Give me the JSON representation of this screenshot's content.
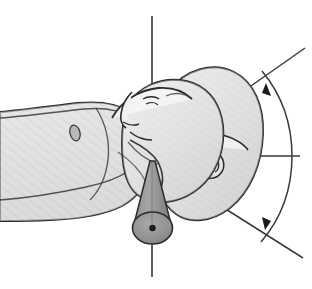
{
  "figure": {
    "title": "Cervical spine rotation range of motion",
    "view": "superior oblique",
    "width": 312,
    "height": 289,
    "background_color": "#ffffff"
  },
  "palette": {
    "background": "#ffffff",
    "skin_light": "#e8e8e8",
    "skin_mid": "#d8d8d8",
    "skin_shadow": "#c2c2c2",
    "skin_highlight": "#f4f4f4",
    "cone_fill": "#9a9a9a",
    "cone_base": "#8e8e8e",
    "outline": "#2b2b2b",
    "line_thin": "#3a3a3a",
    "hatch_stroke": "#cfcfcf"
  },
  "anatomy": {
    "torso": {
      "label": "torso-and-shoulder",
      "fill": "#dedede",
      "hatched": true
    },
    "neck": {
      "label": "neck",
      "fill": "#dcdcdc"
    },
    "head_neutral": {
      "label": "head-neutral-position",
      "fill": "#e2e2e2",
      "position_name": "neutral"
    },
    "head_rotated": {
      "label": "head-rotated-position",
      "fill": "#dcdcdc",
      "position_name": "rotated"
    },
    "ear": {
      "label": "ear",
      "fill": "#e0e0e0"
    },
    "nipple_landmark": {
      "label": "chest-landmark",
      "fill": "#b8b8b8"
    }
  },
  "measurement": {
    "axis_vertical_top": {
      "label": "vertical-reference-axis-superior",
      "stroke": "#3a3a3a"
    },
    "axis_vertical_bottom": {
      "label": "rotation-axis-inferior",
      "stroke": "#3a3a3a"
    },
    "axis_horizontal": {
      "label": "horizontal-reference-axis",
      "stroke": "#3a3a3a"
    },
    "arc": {
      "label": "rotation-arc",
      "stroke": "#3a3a3a",
      "direction": "bidirectional"
    },
    "ray_superior": {
      "label": "angle-ray-superior",
      "stroke": "#3a3a3a"
    },
    "ray_inferior": {
      "label": "angle-ray-inferior",
      "stroke": "#3a3a3a"
    },
    "pivot_cone": {
      "label": "rotation-axis-cone",
      "fill": "#9a9a9a"
    },
    "pivot_point": {
      "label": "rotation-center-point",
      "fill": "#1a1a1a"
    },
    "arrowhead_superior": {
      "label": "arrowhead-superior",
      "fill": "#1a1a1a"
    },
    "arrowhead_inferior": {
      "label": "arrowhead-inferior",
      "fill": "#1a1a1a"
    }
  }
}
